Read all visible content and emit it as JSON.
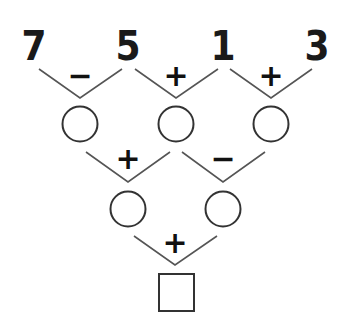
{
  "puzzle": {
    "top_numbers": [
      "7",
      "5",
      "1",
      "3"
    ],
    "row1_operators": [
      "−",
      "+",
      "+"
    ],
    "row2_operators": [
      "+",
      "−"
    ],
    "row3_operators": [
      "+"
    ],
    "row2_blanks": [
      "",
      "",
      ""
    ],
    "row3_blanks": [
      "",
      ""
    ],
    "answer_box": ""
  }
}
